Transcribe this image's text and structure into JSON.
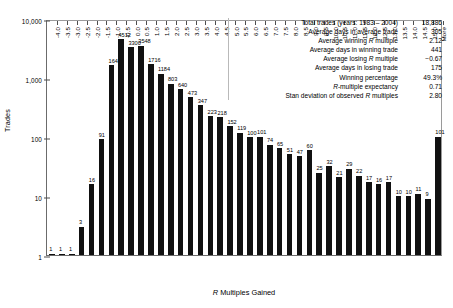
{
  "chart_data": {
    "type": "bar",
    "title": "",
    "xlabel": "R Multiples Gained",
    "ylabel": "Trades",
    "ylim": [
      1,
      10000
    ],
    "yscale": "log",
    "grid": false,
    "legend": "none",
    "ytick_labels": [
      "10,000",
      "1,000",
      "100",
      "10",
      "1"
    ],
    "ytick_values": [
      10000,
      1000,
      100,
      10,
      1
    ],
    "categories": [
      "-4.0",
      "-3.5",
      "-3.0",
      "-2.5",
      "-2.0",
      "-1.5",
      "-1.0",
      "-0.5",
      "0.0",
      "0.5",
      "1.0",
      "1.5",
      "2.0",
      "2.5",
      "3.0",
      "3.5",
      "4.0",
      "4.5",
      "5.0",
      "5.5",
      "6.0",
      "6.5",
      "7.0",
      "7.5",
      "8.0",
      "8.5",
      "9.0",
      "9.5",
      "10.0",
      "10.5",
      "11.0",
      "11.5",
      "12.0",
      "12.5",
      "13.0",
      "13.5",
      "14.0",
      "14.5",
      "15.0",
      "More"
    ],
    "values": [
      1,
      1,
      1,
      3,
      16,
      91,
      1642,
      4512,
      3300,
      3548,
      1716,
      1184,
      803,
      640,
      473,
      347,
      223,
      218,
      152,
      119,
      100,
      101,
      74,
      65,
      51,
      47,
      60,
      25,
      32,
      21,
      29,
      22,
      17,
      16,
      17,
      10,
      10,
      11,
      9,
      101
    ],
    "bar_labels": [
      "1",
      "1",
      "1",
      "3",
      "16",
      "91",
      "1642",
      "4512",
      "3300",
      "3548",
      "1716",
      "1184",
      "803",
      "640",
      "473",
      "347",
      "223",
      "218",
      "152",
      "119",
      "100",
      "101",
      "74",
      "65",
      "51",
      "47",
      "60",
      "25",
      "32",
      "21",
      "29",
      "22",
      "17",
      "16",
      "17",
      "10",
      "10",
      "11",
      "9",
      "101"
    ]
  },
  "stats": {
    "rows": [
      {
        "label_pre": "Total trades (years: 1983 – 2004)",
        "label_italic": "",
        "label_post": "",
        "value": "18,886"
      },
      {
        "label_pre": "Average days in average trade",
        "label_italic": "",
        "label_post": "",
        "value": "305"
      },
      {
        "label_pre": "Average winning ",
        "label_italic": "R",
        "label_post": " multiple",
        "value": "2.12"
      },
      {
        "label_pre": "Average days in winning trade",
        "label_italic": "",
        "label_post": "",
        "value": "441"
      },
      {
        "label_pre": "Average losing ",
        "label_italic": "R",
        "label_post": " multiple",
        "value": "−0.67"
      },
      {
        "label_pre": "Average days in losing trade",
        "label_italic": "",
        "label_post": "",
        "value": "175"
      },
      {
        "label_pre": "Winning percentage",
        "label_italic": "",
        "label_post": "",
        "value": "49.3%"
      },
      {
        "label_pre": "",
        "label_italic": "R",
        "label_post": "-multiple expectancy",
        "value": "0.71"
      },
      {
        "label_pre": "Stan deviation of observed ",
        "label_italic": "R",
        "label_post": " multiples",
        "value": "2.80"
      }
    ]
  },
  "axis": {
    "xlabel_pre": "",
    "xlabel_italic": "R",
    "xlabel_post": " Multiples Gained",
    "ylabel": "Trades"
  }
}
